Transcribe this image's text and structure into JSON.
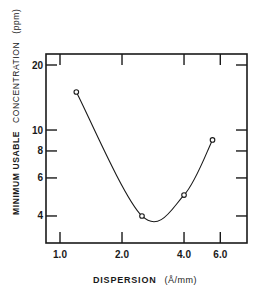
{
  "chart_data": {
    "type": "line",
    "title": "",
    "xlabel": "DISPERSION (Å/mm)",
    "xlabel_parts": {
      "main": "DISPERSION",
      "unit": "(Å/mm)"
    },
    "ylabel": "MINIMUM USABLE CONCENTRATION (ppm)",
    "ylabel_parts": {
      "main": "MINIMUM USABLE",
      "rest": "CONCENTRATION",
      "unit": "(ppm)"
    },
    "x_scale": "log",
    "y_scale": "log",
    "x_ticks": [
      1.0,
      2.0,
      4.0,
      6.0
    ],
    "x_tick_labels": [
      "1.0",
      "2.0",
      "4.0",
      "6.0"
    ],
    "y_ticks": [
      4,
      6,
      8,
      10,
      20
    ],
    "y_tick_labels": [
      "4",
      "6",
      "8",
      "10",
      "20"
    ],
    "xlim": [
      0.85,
      7.5
    ],
    "ylim": [
      3.0,
      22
    ],
    "grid": false,
    "legend": null,
    "series": [
      {
        "name": "Minimum usable concentration",
        "style": "smooth curve with open circle markers",
        "x": [
          1.2,
          2.5,
          4.0,
          5.5
        ],
        "y": [
          15,
          4,
          5,
          9
        ]
      }
    ]
  }
}
